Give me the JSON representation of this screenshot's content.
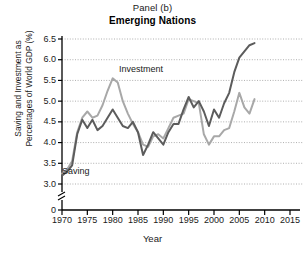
{
  "figure": {
    "panel_label": "Panel (b)",
    "title": "Emerging Nations",
    "xlabel": "Year",
    "ylabel_line1": "Saving and Investment as",
    "ylabel_line2": "Percentages of World GDP (%)"
  },
  "colors": {
    "saving_line": "#5c5c5c",
    "investment_line": "#a8a8a8",
    "axis": "#000000",
    "gridline": "#9a9a9a",
    "text": "#1a1a1a"
  },
  "chart_data": {
    "type": "line",
    "title": "Emerging Nations",
    "subtitle": "Panel (b)",
    "xlabel": "Year",
    "ylabel": "Saving and Investment as Percentages of World GDP (%)",
    "xlim": [
      1970,
      2015
    ],
    "ylim": [
      3.0,
      6.5
    ],
    "y_axis_break": true,
    "y_axis_break_label": "0",
    "grid": true,
    "grid_axis": "y",
    "legend": "inline-annotations",
    "xticks": [
      1970,
      1975,
      1980,
      1985,
      1990,
      1995,
      2000,
      2005,
      2010,
      2015
    ],
    "yticks": [
      3.0,
      3.5,
      4.0,
      4.5,
      5.0,
      5.5,
      6.0,
      6.5
    ],
    "ytick_labels": [
      "3.0",
      "3.5",
      "4.0",
      "4.5",
      "5.0",
      "5.5",
      "6.0",
      "6.5"
    ],
    "xtick_labels": [
      "1970",
      "1975",
      "1980",
      "1985",
      "1990",
      "1995",
      "2000",
      "2005",
      "2010",
      "2015"
    ],
    "x": [
      1970,
      1971,
      1972,
      1973,
      1974,
      1975,
      1976,
      1977,
      1978,
      1979,
      1980,
      1981,
      1982,
      1983,
      1984,
      1985,
      1986,
      1987,
      1988,
      1989,
      1990,
      1991,
      1992,
      1993,
      1994,
      1995,
      1996,
      1997,
      1998,
      1999,
      2000,
      2001,
      2002,
      2003,
      2004,
      2005,
      2006,
      2007,
      2008
    ],
    "series": [
      {
        "name": "Investment",
        "color": "#a8a8a8",
        "annotation": "Investment",
        "values": [
          3.25,
          3.35,
          3.55,
          4.25,
          4.6,
          4.75,
          4.6,
          4.65,
          4.9,
          5.25,
          5.55,
          5.45,
          5.0,
          4.7,
          4.45,
          4.25,
          3.95,
          3.9,
          4.15,
          4.2,
          4.1,
          4.35,
          4.6,
          4.65,
          4.7,
          5.05,
          5.0,
          4.95,
          4.2,
          3.95,
          4.15,
          4.15,
          4.3,
          4.35,
          4.75,
          5.2,
          4.85,
          4.7,
          5.05
        ]
      },
      {
        "name": "Saving",
        "color": "#5c5c5c",
        "annotation": "Saving",
        "values": [
          3.2,
          3.3,
          3.45,
          4.2,
          4.55,
          4.35,
          4.55,
          4.3,
          4.4,
          4.6,
          4.8,
          4.6,
          4.4,
          4.35,
          4.5,
          4.25,
          3.7,
          3.95,
          4.25,
          4.1,
          3.95,
          4.25,
          4.45,
          4.45,
          4.8,
          5.1,
          4.85,
          5.0,
          4.75,
          4.4,
          4.8,
          4.6,
          4.95,
          5.2,
          5.7,
          6.05,
          6.2,
          6.35,
          6.4
        ]
      }
    ]
  }
}
